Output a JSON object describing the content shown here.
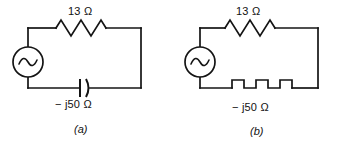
{
  "figure": {
    "type": "circuit-diagram",
    "line_color": "#141414",
    "background_color": "#ffffff"
  },
  "circuits": [
    {
      "id": "a",
      "caption": "(a)",
      "source": {
        "symbol": "ac-source",
        "label": ""
      },
      "elements": [
        {
          "symbol": "resistor",
          "position": "top",
          "value": "13",
          "unit": "Ω",
          "label": "13 Ω"
        },
        {
          "symbol": "capacitor",
          "position": "bottom",
          "sign": "−",
          "imaginary": "j",
          "value": "50",
          "unit": "Ω",
          "label": "− j50 Ω"
        }
      ]
    },
    {
      "id": "b",
      "caption": "(b)",
      "source": {
        "symbol": "ac-source",
        "label": ""
      },
      "elements": [
        {
          "symbol": "resistor",
          "position": "top",
          "value": "13",
          "unit": "Ω",
          "label": "13 Ω"
        },
        {
          "symbol": "square-wave-reactance",
          "position": "bottom",
          "sign": "−",
          "imaginary": "j",
          "value": "50",
          "unit": "Ω",
          "label": "− j50 Ω"
        }
      ]
    }
  ]
}
